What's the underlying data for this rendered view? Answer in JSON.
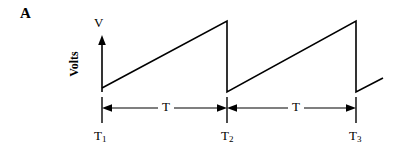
{
  "figure": {
    "panel_letter": "A",
    "background_color": "#ffffff",
    "stroke_color": "#000000",
    "width": 399,
    "height": 160
  },
  "axes": {
    "y_axis_symbol": "V",
    "y_axis_name": "Volts",
    "y_axis_arrow": {
      "x": 102,
      "y_bottom": 92,
      "y_tip": 38
    }
  },
  "period_labels": [
    {
      "label": "T",
      "x": 165
    },
    {
      "label": "T",
      "x": 295
    }
  ],
  "time_ticks": [
    {
      "label": "T",
      "subscript": "1",
      "x": 102
    },
    {
      "label": "T",
      "subscript": "2",
      "x": 227
    },
    {
      "label": "T",
      "subscript": "3",
      "x": 356
    }
  ],
  "chart_data": {
    "type": "line",
    "title": "",
    "xlabel": "",
    "ylabel": "Volts",
    "grid": false,
    "legend": false,
    "waveform": "sawtooth",
    "periods": 2,
    "series": [
      {
        "name": "sawtooth-voltage",
        "points": [
          [
            102,
            88
          ],
          [
            227,
            21
          ],
          [
            227,
            92
          ],
          [
            356,
            21
          ],
          [
            356,
            92
          ],
          [
            383,
            78
          ]
        ]
      }
    ],
    "baseline_y": 108,
    "tick_x_positions": [
      102,
      227,
      356
    ],
    "tick_labels": [
      "T1",
      "T2",
      "T3"
    ],
    "interval_labels": [
      "T",
      "T"
    ]
  }
}
